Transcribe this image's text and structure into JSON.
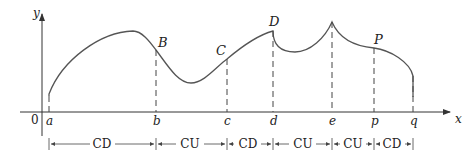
{
  "diagram": {
    "axes": {
      "x_label": "x",
      "y_label": "y",
      "origin_label": "0"
    },
    "x_ticks": [
      {
        "label": "a",
        "x": 49
      },
      {
        "label": "b",
        "x": 156
      },
      {
        "label": "c",
        "x": 227
      },
      {
        "label": "d",
        "x": 273
      },
      {
        "label": "e",
        "x": 332
      },
      {
        "label": "p",
        "x": 374
      },
      {
        "label": "q",
        "x": 413
      }
    ],
    "points": [
      {
        "label": "B",
        "x": 156,
        "y": 50
      },
      {
        "label": "C",
        "x": 227,
        "y": 59
      },
      {
        "label": "D",
        "x": 273,
        "y": 31
      },
      {
        "label": "P",
        "x": 374,
        "y": 48
      }
    ],
    "intervals": [
      {
        "label": "CD",
        "from": "a",
        "to": "b"
      },
      {
        "label": "CU",
        "from": "b",
        "to": "c"
      },
      {
        "label": "CD",
        "from": "c",
        "to": "d"
      },
      {
        "label": "CU",
        "from": "d",
        "to": "e"
      },
      {
        "label": "CU",
        "from": "e",
        "to": "p"
      },
      {
        "label": "CD",
        "from": "p",
        "to": "q"
      }
    ]
  }
}
